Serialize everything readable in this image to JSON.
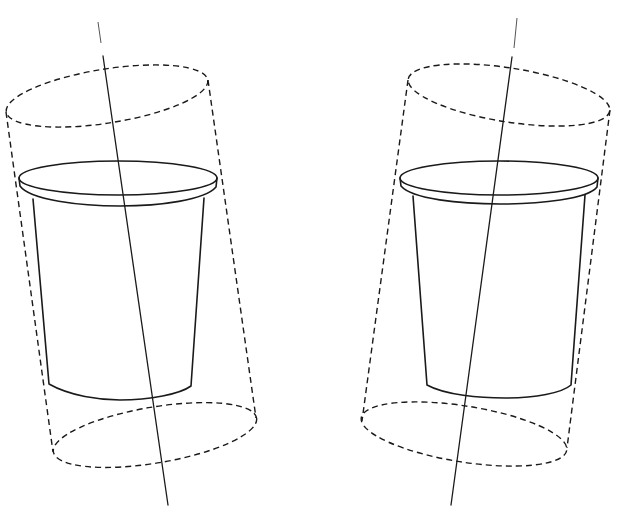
{
  "figure": {
    "stroke_color": "#1a1a1a",
    "background": "#ffffff",
    "panels": [
      {
        "id": "left",
        "tilt": "axis leans right toward bottom",
        "axis": {
          "x1": 103,
          "y1": 56,
          "x2": 168,
          "y2": 505,
          "faint_x1": 98,
          "faint_y1": 22,
          "faint_x2": 101,
          "faint_y2": 43
        },
        "cylinder_top": {
          "cx": 107,
          "cy": 96,
          "rx": 102,
          "ry": 27,
          "rot": -9
        },
        "cylinder_bottom": {
          "cx": 155,
          "cy": 435,
          "rx": 103,
          "ry": 28,
          "rot": -9.5
        },
        "cup_rim": {
          "cx": 118,
          "cy": 178,
          "rx": 99,
          "ry": 17
        }
      },
      {
        "id": "right",
        "tilt": "axis leans left toward bottom",
        "axis": {
          "x1": 512,
          "y1": 57,
          "x2": 451,
          "y2": 505,
          "faint_x1": 517,
          "faint_y1": 18,
          "faint_x2": 514,
          "faint_y2": 48
        },
        "cylinder_top": {
          "cx": 509,
          "cy": 95,
          "rx": 102,
          "ry": 27,
          "rot": 9
        },
        "cylinder_bottom": {
          "cx": 464,
          "cy": 434,
          "rx": 104,
          "ry": 28,
          "rot": 9
        },
        "cup_rim": {
          "cx": 499,
          "cy": 178,
          "rx": 99,
          "ry": 17
        }
      }
    ]
  }
}
